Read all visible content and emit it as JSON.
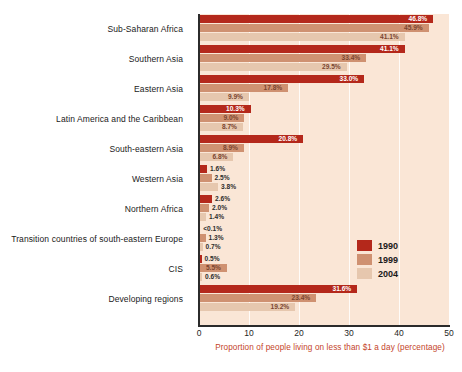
{
  "chart_data": {
    "type": "bar",
    "orientation": "horizontal",
    "title": "",
    "xlabel": "Proportion of people living on less than $1 a day (percentage)",
    "ylabel": "",
    "xlim": [
      0,
      50
    ],
    "xticks": [
      0,
      10,
      20,
      30,
      40,
      50
    ],
    "grid": true,
    "legend_position": "inside-right",
    "categories": [
      "Sub-Saharan Africa",
      "Southern Asia",
      "Eastern Asia",
      "Latin America and the Caribbean",
      "South-eastern Asia",
      "Western Asia",
      "Northern Africa",
      "Transition countries of south-eastern Europe",
      "CIS",
      "Developing regions"
    ],
    "series": [
      {
        "name": "1990",
        "color": "#b4281b",
        "values": [
          46.8,
          41.1,
          33.0,
          10.3,
          20.8,
          1.6,
          2.6,
          0.05,
          0.5,
          31.6
        ],
        "labels": [
          "46.8%",
          "41.1%",
          "33.0%",
          "10.3%",
          "20.8%",
          "1.6%",
          "2.6%",
          "<0.1%",
          "0.5%",
          "31.6%"
        ]
      },
      {
        "name": "1999",
        "color": "#cf9171",
        "values": [
          45.9,
          33.4,
          17.8,
          9.0,
          8.9,
          2.5,
          2.0,
          1.3,
          5.5,
          23.4
        ],
        "labels": [
          "45.9%",
          "33.4%",
          "17.8%",
          "9.0%",
          "8.9%",
          "2.5%",
          "2.0%",
          "1.3%",
          "5.5%",
          "23.4%"
        ]
      },
      {
        "name": "2004",
        "color": "#e6c7ae",
        "values": [
          41.1,
          29.5,
          9.9,
          8.7,
          6.8,
          3.8,
          1.4,
          0.7,
          0.6,
          19.2
        ],
        "labels": [
          "41.1%",
          "29.5%",
          "9.9%",
          "8.7%",
          "6.8%",
          "3.8%",
          "1.4%",
          "0.7%",
          "0.6%",
          "19.2%"
        ]
      }
    ],
    "plot_background": "#fae6d6",
    "axis_title_color": "#c4442a"
  },
  "legend": {
    "items": [
      {
        "label": "1990",
        "color": "#b4281b"
      },
      {
        "label": "1999",
        "color": "#cf9171"
      },
      {
        "label": "2004",
        "color": "#e6c7ae"
      }
    ]
  }
}
